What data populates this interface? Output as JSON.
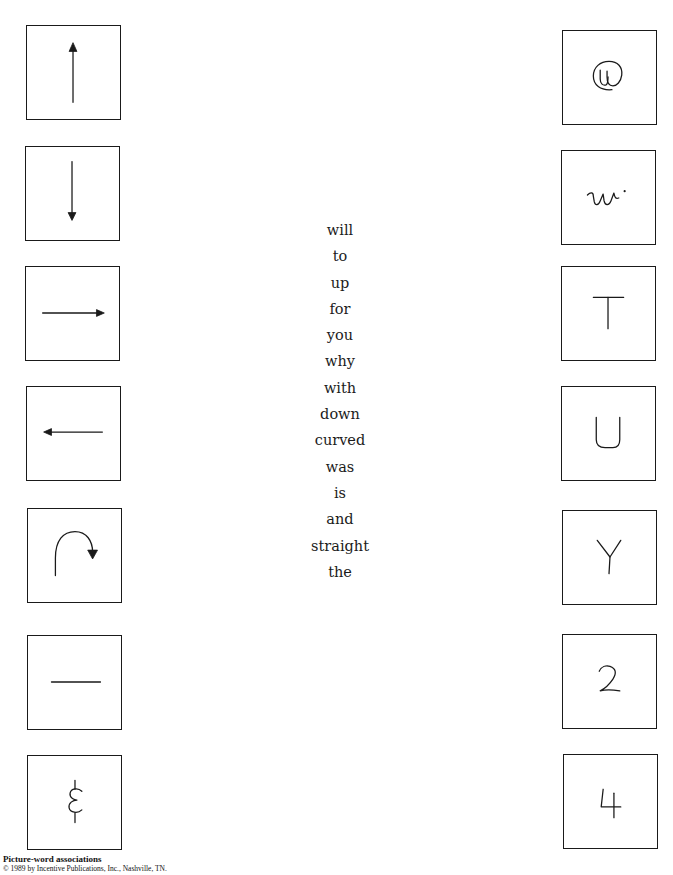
{
  "worksheet": {
    "left_column": [
      {
        "id": "up-arrow",
        "icon": "arrow-up-icon"
      },
      {
        "id": "down-arrow",
        "icon": "arrow-down-icon"
      },
      {
        "id": "right-arrow",
        "icon": "arrow-right-icon"
      },
      {
        "id": "left-arrow",
        "icon": "arrow-left-icon"
      },
      {
        "id": "curved-arrow",
        "icon": "curved-arrow-icon"
      },
      {
        "id": "straight-line",
        "icon": "straight-line-icon"
      },
      {
        "id": "curvy-line",
        "icon": "squiggle-line-icon"
      }
    ],
    "words": [
      "will",
      "to",
      "up",
      "for",
      "you",
      "why",
      "with",
      "down",
      "curved",
      "was",
      "is",
      "and",
      "straight",
      "the"
    ],
    "right_column": [
      {
        "glyph": "@",
        "icon": "at-sign-icon"
      },
      {
        "glyph": "w",
        "icon": "cursive-w-icon"
      },
      {
        "glyph": "T",
        "icon": "letter-t-icon"
      },
      {
        "glyph": "U",
        "icon": "letter-u-icon"
      },
      {
        "glyph": "Y",
        "icon": "letter-y-icon"
      },
      {
        "glyph": "2",
        "icon": "number-2-icon"
      },
      {
        "glyph": "4",
        "icon": "number-4-icon"
      }
    ]
  },
  "footer": {
    "title": "Picture-word associations",
    "copyright": "© 1989 by Incentive Publications, Inc., Nashville, TN."
  }
}
